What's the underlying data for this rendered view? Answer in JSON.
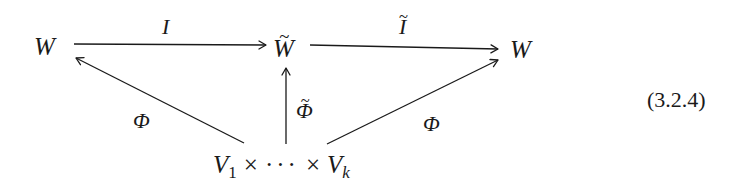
{
  "diagram": {
    "nodes": {
      "left_W": "W",
      "middle_W_tilde": "W",
      "middle_tilde_mark": "~",
      "right_W": "W",
      "bottom": {
        "V1": "V",
        "V1_sub": "1",
        "times1": "×",
        "dots": "···",
        "times2": "×",
        "Vk": "V",
        "Vk_sub": "k"
      }
    },
    "arrow_labels": {
      "top_left": "I",
      "top_right": "I",
      "top_right_tilde": "~",
      "diag_left": "Φ",
      "vertical": "Φ",
      "vertical_tilde": "~",
      "diag_right": "Φ"
    },
    "arrows": [
      {
        "from": "W",
        "to": "W̃",
        "label": "I"
      },
      {
        "from": "W̃",
        "to": "W",
        "label": "Ĩ"
      },
      {
        "from": "V1×···×Vk",
        "to": "W (left)",
        "label": "Φ"
      },
      {
        "from": "V1×···×Vk",
        "to": "W̃",
        "label": "Φ̃"
      },
      {
        "from": "V1×···×Vk",
        "to": "W (right)",
        "label": "Φ"
      }
    ],
    "colors": {
      "ink": "#1a1a1a",
      "background": "#ffffff"
    }
  },
  "equation_number": "(3.2.4)"
}
